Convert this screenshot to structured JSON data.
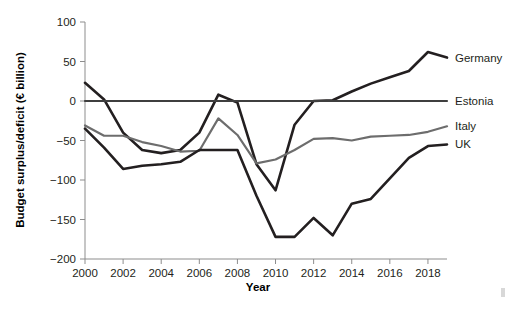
{
  "chart_data": {
    "type": "line",
    "title": "",
    "xlabel": "Year",
    "ylabel": "Budget surplus/deficit (€ billion)",
    "xlim": [
      2000,
      2019
    ],
    "ylim": [
      -200,
      100
    ],
    "xticks": [
      2000,
      2002,
      2004,
      2006,
      2008,
      2010,
      2012,
      2014,
      2016,
      2018
    ],
    "yticks": [
      -200,
      -150,
      -100,
      -50,
      0,
      50,
      100
    ],
    "xtick_labels": [
      "2000",
      "2002",
      "2004",
      "2006",
      "2008",
      "2010",
      "2012",
      "2014",
      "2016",
      "2018"
    ],
    "ytick_labels": [
      "−200",
      "−150",
      "−100",
      "−50",
      "0",
      "50",
      "100"
    ],
    "grid": false,
    "legend_position": "right-of-axes",
    "x": [
      2000,
      2001,
      2002,
      2003,
      2004,
      2005,
      2006,
      2007,
      2008,
      2009,
      2010,
      2011,
      2012,
      2013,
      2014,
      2015,
      2016,
      2017,
      2018,
      2019
    ],
    "series": [
      {
        "name": "Germany",
        "color": "#231f20",
        "width": 2.6,
        "values": [
          23,
          2,
          -40,
          -62,
          -66,
          -62,
          -40,
          8,
          -2,
          -80,
          -113,
          -30,
          0,
          1,
          12,
          22,
          30,
          38,
          62,
          55
        ]
      },
      {
        "name": "Estonia",
        "color": "#3f3f3f",
        "width": 2.2,
        "values": [
          0,
          0,
          0,
          0,
          0,
          0,
          0,
          0,
          0,
          0,
          0,
          0,
          0,
          0,
          0,
          0,
          0,
          0,
          0,
          0
        ]
      },
      {
        "name": "Italy",
        "color": "#6d6d6d",
        "width": 2.2,
        "values": [
          -31,
          -44,
          -44,
          -52,
          -57,
          -64,
          -63,
          -22,
          -43,
          -79,
          -74,
          -62,
          -48,
          -47,
          -50,
          -45,
          -44,
          -43,
          -39,
          -32
        ]
      },
      {
        "name": "UK",
        "color": "#231f20",
        "width": 2.6,
        "values": [
          -35,
          -59,
          -86,
          -82,
          -80,
          -77,
          -62,
          -62,
          -62,
          -120,
          -172,
          -172,
          -148,
          -170,
          -130,
          -124,
          -98,
          -72,
          -57,
          -55
        ]
      }
    ],
    "legend_entries": [
      {
        "label": "Germany",
        "color": "#231f20"
      },
      {
        "label": "Estonia",
        "color": "#3f3f3f"
      },
      {
        "label": "Italy",
        "color": "#6d6d6d"
      },
      {
        "label": "UK",
        "color": "#231f20"
      }
    ]
  }
}
